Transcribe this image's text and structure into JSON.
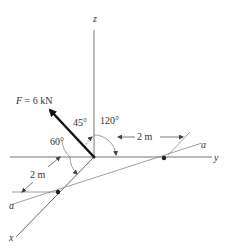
{
  "diagram": {
    "axes": {
      "x": "x",
      "y": "y",
      "z": "z"
    },
    "force": {
      "label": "F = 6 kN",
      "var": "F",
      "eq": " = 6 kN"
    },
    "angles": {
      "alpha": "60°",
      "beta": "45°",
      "gamma": "120°"
    },
    "dimensions": {
      "top": "2 m",
      "left": "2 m"
    },
    "line_labels": {
      "upper": "a",
      "lower": "a"
    }
  }
}
